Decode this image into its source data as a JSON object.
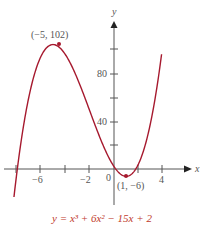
{
  "chart_data": {
    "type": "line",
    "title": "",
    "equation": "y = x³ + 6x² − 15x + 2",
    "xlabel": "x",
    "ylabel": "y",
    "xlim": [
      -8.5,
      7.5
    ],
    "ylim": [
      -40,
      120
    ],
    "x_ticks": [
      -8,
      -6,
      -4,
      -2,
      0,
      2,
      4
    ],
    "x_tick_labels": [
      "-6",
      "-2",
      "0",
      "4"
    ],
    "y_ticks": [
      20,
      40,
      60,
      80,
      100
    ],
    "y_tick_labels": [
      "40",
      "80"
    ],
    "grid": false,
    "series": [
      {
        "name": "y = x^3 + 6x^2 - 15x + 2",
        "color": "#a6192e"
      }
    ],
    "annotations": [
      {
        "x": -5,
        "y": 102,
        "label": "(−5, 102)",
        "type": "local-maximum"
      },
      {
        "x": 1,
        "y": -6,
        "label": "(1, −6)",
        "type": "local-minimum"
      }
    ]
  },
  "labels": {
    "x_axis": "x",
    "y_axis": "y",
    "tick_neg6": "−6",
    "tick_neg2": "−2",
    "tick_0": "0",
    "tick_4": "4",
    "tick_40": "40",
    "tick_80": "80",
    "max_point": "(−5, 102)",
    "min_point": "(1, −6)",
    "caption": "y = x³ + 6x² − 15x + 2"
  },
  "colors": {
    "curve": "#a6192e",
    "axis": "#555555",
    "caption": "#c0392b"
  }
}
